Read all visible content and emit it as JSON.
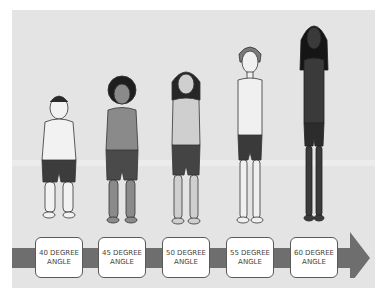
{
  "diagram": {
    "type": "illustration-sequence",
    "background_color": "#e4e4e4",
    "arrow_color": "#6e6e6e",
    "figures": [
      {
        "id": 1,
        "skin": "#f2f2f2",
        "hair": "#2a2a2a",
        "shorts": "#3c3c3c",
        "height_rank": 1
      },
      {
        "id": 2,
        "skin": "#8a8a8a",
        "hair": "#1e1e1e",
        "shorts": "#4a4a4a",
        "height_rank": 2
      },
      {
        "id": 3,
        "skin": "#cfcfcf",
        "hair": "#262626",
        "shorts": "#444444",
        "height_rank": 3
      },
      {
        "id": 4,
        "skin": "#f0f0f0",
        "hair": "#7a7a7a",
        "shorts": "#3a3a3a",
        "height_rank": 4
      },
      {
        "id": 5,
        "skin": "#3a3a3a",
        "hair": "#151515",
        "shorts": "#2c2c2c",
        "height_rank": 5
      }
    ],
    "labels": [
      {
        "line1": "40 DEGREE",
        "line2": "ANGLE"
      },
      {
        "line1": "45 DEGREE",
        "line2": "ANGLE"
      },
      {
        "line1": "50 DEGREE",
        "line2": "ANGLE"
      },
      {
        "line1": "55 DEGREE",
        "line2": "ANGLE"
      },
      {
        "line1": "60 DEGREE",
        "line2": "ANGLE"
      }
    ]
  }
}
